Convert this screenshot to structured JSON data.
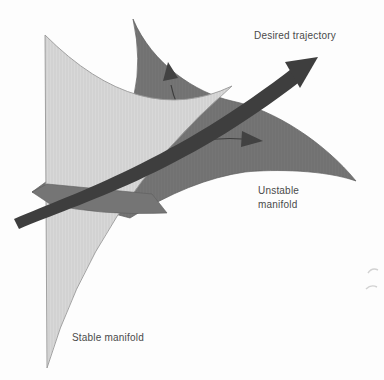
{
  "figure": {
    "type": "dynamical-systems-manifold-diagram",
    "labels": {
      "desired_trajectory": "Desired trajectory",
      "unstable_line1": "Unstable",
      "unstable_line2": "manifold",
      "stable_manifold": "Stable manifold"
    },
    "colors": {
      "background": "#fdfdfd",
      "stable_manifold_fill": "#d8d8d8",
      "stable_manifold_edge": "#9a9a9a",
      "unstable_manifold_fill": "#757575",
      "unstable_manifold_edge": "#5e5e5e",
      "trajectory_arrow": "#3e3e3e",
      "flow_arrow": "#424242",
      "label_text": "#4a4a4a",
      "smudge": "#c8c8c8"
    }
  }
}
